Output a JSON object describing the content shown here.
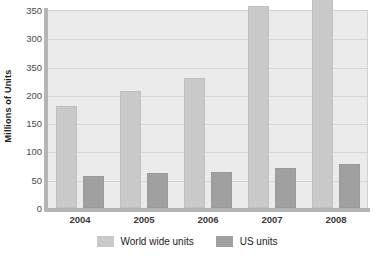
{
  "chart_data": {
    "type": "bar",
    "title": "",
    "xlabel": "",
    "ylabel": "Millions of Units",
    "categories": [
      "2004",
      "2005",
      "2006",
      "2007",
      "2008"
    ],
    "series": [
      {
        "name": "World wide units",
        "color": "#c9c9c9",
        "values": [
          180,
          206,
          230,
          357,
          383
        ]
      },
      {
        "name": "US units",
        "color": "#a0a0a0",
        "values": [
          57,
          62,
          63,
          70,
          78
        ]
      }
    ],
    "ylim": [
      0,
      350
    ],
    "y_tick_values": [
      0,
      50,
      100,
      150,
      200,
      250,
      300,
      350
    ],
    "y_tick_labels": [
      "0",
      "50",
      "100",
      "150",
      "200",
      "350",
      "300",
      "350"
    ],
    "grid": true,
    "legend_position": "bottom",
    "plot_background": "#ebebeb",
    "axis_color": "#b5b5b5",
    "gridline_color": "#d6d6d6"
  }
}
